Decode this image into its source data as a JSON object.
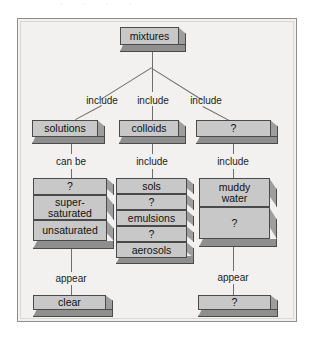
{
  "figure": {
    "type": "concept-map",
    "top_strip_text": "· · · ·"
  },
  "nodes": {
    "root": "mixtures",
    "level1": [
      {
        "label": "solutions"
      },
      {
        "label": "colloids"
      },
      {
        "label": "?"
      }
    ],
    "solutions_stack": [
      {
        "label": "?"
      },
      {
        "label": "super-",
        "label2": "saturated"
      },
      {
        "label": "unsaturated"
      }
    ],
    "colloids_stack": [
      {
        "label": "sols"
      },
      {
        "label": "?"
      },
      {
        "label": "emulsions"
      },
      {
        "label": "?"
      },
      {
        "label": "aerosols"
      }
    ],
    "suspensions_stack": [
      {
        "label": "muddy",
        "label2": "water"
      },
      {
        "label": "?"
      }
    ],
    "solutions_result": "clear",
    "suspensions_result": "?"
  },
  "edge_labels": {
    "include_left": "include",
    "include_mid": "include",
    "include_right": "include",
    "can_be": "can be",
    "include_colloids": "include",
    "include_suspensions": "include",
    "appear_left": "appear",
    "appear_right": "appear"
  },
  "colors": {
    "page_bg": "#ffffff",
    "frame_bg": "#f2f1ef",
    "frame_border": "#8e8e8e",
    "box_face": "#c8c8c8",
    "box_side": "#9e9e9e",
    "box_bottom": "#8f8f8f",
    "box_outline": "#4a4a4a",
    "connector": "#6e6e6e",
    "text": "#1c1c1c"
  }
}
